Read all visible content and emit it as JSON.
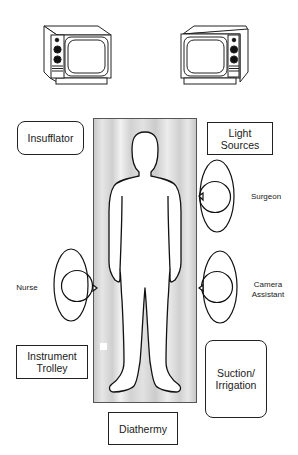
{
  "diagram": {
    "type": "operating_room_layout",
    "monitors": [
      {
        "id": "monitor-left",
        "label": ""
      },
      {
        "id": "monitor-right",
        "label": ""
      }
    ],
    "equipment": {
      "insufflator": "Insufflator",
      "light_sources": "Light\nSources",
      "light_sources_line1": "Light",
      "light_sources_line2": "Sources",
      "instrument_trolley_line1": "Instrument",
      "instrument_trolley_line2": "Trolley",
      "suction_line1": "Suction/",
      "suction_line2": "Irrigation",
      "diathermy": "Diathermy"
    },
    "personnel": {
      "surgeon": "Surgeon",
      "nurse": "Nurse",
      "camera_assistant_line1": "Camera",
      "camera_assistant_line2": "Assistant"
    },
    "colors": {
      "stroke": "#222222",
      "table_fill": "#d8d8d8",
      "background": "#ffffff"
    }
  }
}
